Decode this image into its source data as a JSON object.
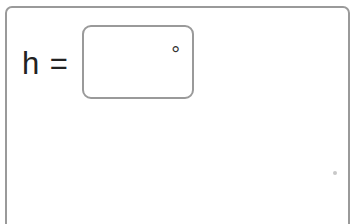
{
  "question": {
    "variable_label": "h =",
    "answer_input": {
      "value": "",
      "unit_symbol": "°"
    }
  }
}
